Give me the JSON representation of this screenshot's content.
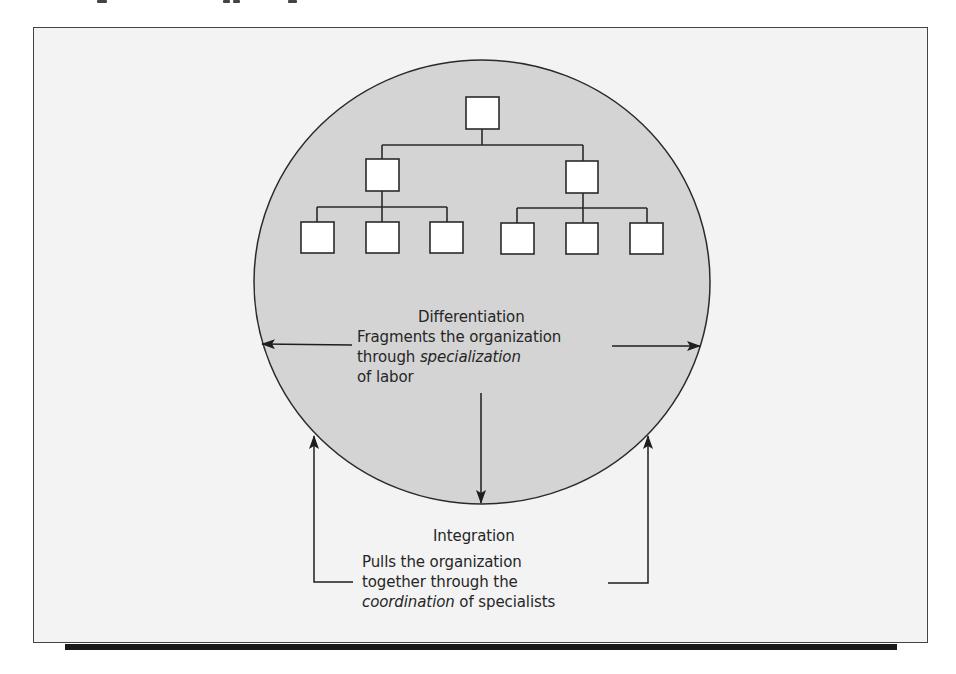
{
  "figure": {
    "colors": {
      "page_background": "#ffffff",
      "frame_background": "#f3f3f3",
      "frame_border": "#444444",
      "circle_fill": "#d4d4d4",
      "line_color": "#2a2a2a",
      "org_box_fill": "#ffffff",
      "underbar": "#1a1a1a"
    },
    "org_chart": {
      "levels": 3,
      "top_boxes": 1,
      "middle_boxes": 2,
      "bottom_boxes_per_middle": 3
    },
    "differentiation": {
      "title": "Differentiation",
      "line1": "Fragments the organization",
      "line2_prefix": "through ",
      "line2_emphasis": "specialization",
      "line3": "of labor",
      "arrow": "double-headed-horizontal"
    },
    "integration": {
      "title": "Integration",
      "line1": "Pulls the organization",
      "line2": "together through the",
      "line3_emphasis": "coordination",
      "line3_suffix": " of specialists",
      "arrows": "upward-bracket-left-and-right"
    }
  }
}
